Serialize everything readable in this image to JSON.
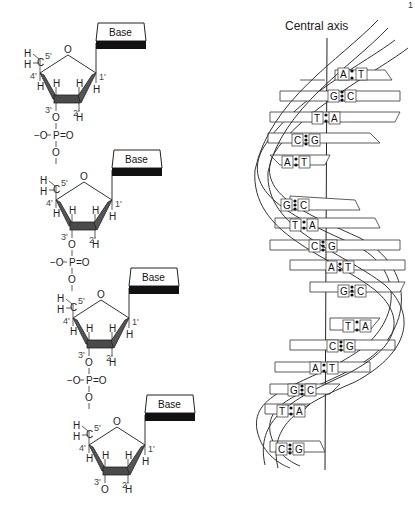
{
  "page_number": "1",
  "helix": {
    "title": "Central axis",
    "base_pairs": [
      {
        "left": "A",
        "right": "T",
        "bonds": 2
      },
      {
        "left": "G",
        "right": "C",
        "bonds": 3
      },
      {
        "left": "T",
        "right": "A",
        "bonds": 2
      },
      {
        "left": "C",
        "right": "G",
        "bonds": 3
      },
      {
        "left": "A",
        "right": "T",
        "bonds": 2
      },
      {
        "left": "G",
        "right": "C",
        "bonds": 3
      },
      {
        "left": "T",
        "right": "A",
        "bonds": 2
      },
      {
        "left": "C",
        "right": "G",
        "bonds": 3
      },
      {
        "left": "A",
        "right": "T",
        "bonds": 2
      },
      {
        "left": "G",
        "right": "C",
        "bonds": 3
      },
      {
        "left": "T",
        "right": "A",
        "bonds": 2
      },
      {
        "left": "C",
        "right": "G",
        "bonds": 3
      },
      {
        "left": "A",
        "right": "T",
        "bonds": 2
      },
      {
        "left": "G",
        "right": "C",
        "bonds": 3
      },
      {
        "left": "T",
        "right": "A",
        "bonds": 2
      },
      {
        "left": "C",
        "right": "G",
        "bonds": 3
      }
    ]
  },
  "strand": {
    "nucleotides": [
      {
        "base_label": "Base"
      },
      {
        "base_label": "Base"
      },
      {
        "base_label": "Base"
      },
      {
        "base_label": "Base"
      }
    ],
    "atoms": {
      "ring_oxygen": "O",
      "hydrogen": "H",
      "carbon": "C",
      "oxygen": "O",
      "phosphorus": "P",
      "phosphate_charge": "−O",
      "double_bond_o": "=O"
    },
    "carbon_numbers": {
      "c1": "1'",
      "c2": "2'",
      "c3": "3'",
      "c4": "4'",
      "c5": "5'"
    }
  }
}
